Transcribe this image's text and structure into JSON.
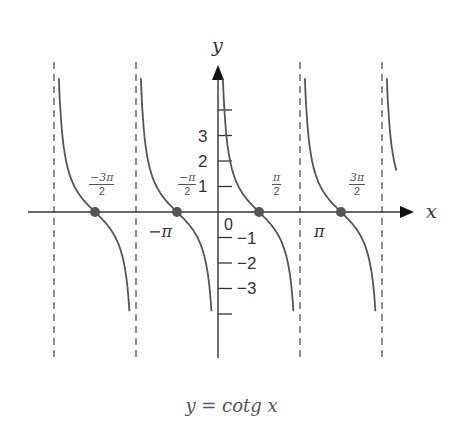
{
  "chart_data": {
    "type": "line",
    "title": "y = cotg x",
    "function": "cot",
    "xlabel": "x",
    "ylabel": "y",
    "x_range": [
      -5.3,
      6.8
    ],
    "y_range": [
      -4.0,
      5.7
    ],
    "grid": false,
    "legend": null,
    "asymptotes": [
      "-2π",
      "-π",
      "0",
      "π",
      "2π"
    ],
    "zeros": [
      "-3π/2",
      "-π/2",
      "π/2",
      "3π/2"
    ],
    "y_ticks": [
      -4,
      -3,
      -2,
      -1,
      1,
      2,
      3,
      4
    ],
    "y_tick_labels": [
      "-3",
      "-2",
      "-1",
      "1",
      "2",
      "3"
    ],
    "x_tick_labels": [
      "−π",
      "π"
    ],
    "origin_label": "0",
    "zero_labels": [
      {
        "num": "−3π",
        "den": "2"
      },
      {
        "num": "−π",
        "den": "2"
      },
      {
        "num": "π",
        "den": "2"
      },
      {
        "num": "3π",
        "den": "2"
      }
    ],
    "branches": [
      {
        "from": "-2π",
        "to": "-π"
      },
      {
        "from": "-π",
        "to": "0"
      },
      {
        "from": "0",
        "to": "π"
      },
      {
        "from": "π",
        "to": "2π"
      },
      {
        "from": "2π",
        "to": "partial"
      }
    ],
    "sample_points": [
      {
        "x": "-3π/2",
        "y": 0
      },
      {
        "x": "-π/2",
        "y": 0
      },
      {
        "x": "π/4",
        "y": 1
      },
      {
        "x": "π/2",
        "y": 0
      },
      {
        "x": "3π/4",
        "y": -1
      },
      {
        "x": "3π/2",
        "y": 0
      }
    ]
  },
  "labels": {
    "x_axis": "x",
    "y_axis": "y",
    "origin": "0",
    "y_pos": [
      "1",
      "2",
      "3"
    ],
    "y_neg": [
      "−1",
      "−2",
      "−3"
    ],
    "minus_pi": "−π",
    "pi": "π",
    "frac_m3pi2_num": "−3π",
    "frac_m3pi2_den": "2",
    "frac_mpi2_num": "−π",
    "frac_mpi2_den": "2",
    "frac_pi2_num": "π",
    "frac_pi2_den": "2",
    "frac_3pi2_num": "3π",
    "frac_3pi2_den": "2"
  },
  "caption": "y = cotg x",
  "colors": {
    "curve": "#555555",
    "axis": "#333333",
    "dot": "#555555",
    "asymptote": "#444444"
  }
}
